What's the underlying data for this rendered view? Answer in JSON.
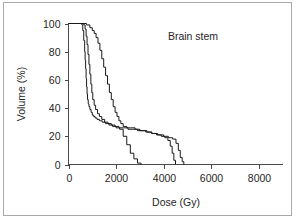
{
  "figure": {
    "background_color": "#ffffff",
    "border_color": "#a9a9a9",
    "line_color": "#1a1a1a",
    "text_color": "#262626"
  },
  "chart_data": {
    "type": "line",
    "title": "Brain stem",
    "xlabel": "Dose (Gy)",
    "ylabel": "Volume (%)",
    "xlim": [
      0,
      9000
    ],
    "ylim": [
      0,
      100
    ],
    "xticks": [
      0,
      2000,
      4000,
      6000,
      8000
    ],
    "xtick_labels": [
      "0",
      "2000",
      "4000",
      "6000",
      "8000"
    ],
    "yticks": [
      0,
      20,
      40,
      60,
      80,
      100
    ],
    "ytick_labels": [
      "0",
      "20",
      "40",
      "60",
      "80",
      "100"
    ],
    "grid": false,
    "legend": "none",
    "series": [
      {
        "name": "curve-1",
        "x": [
          0,
          420,
          560,
          600,
          640,
          680,
          700,
          720,
          740,
          760,
          780,
          800,
          830,
          860,
          900,
          950,
          1000,
          1060,
          1120,
          1200,
          1300,
          1420,
          1560,
          1700,
          1850,
          2000,
          2150,
          2300,
          2450,
          2600,
          2750,
          2900,
          3050
        ],
        "y": [
          100,
          100,
          99,
          95,
          88,
          80,
          74,
          68,
          61,
          55,
          50,
          46,
          43,
          41,
          39,
          37,
          35,
          34,
          33,
          32,
          31,
          30,
          29,
          28,
          27,
          26,
          25,
          20,
          14,
          8,
          4,
          1,
          0
        ]
      },
      {
        "name": "curve-2",
        "x": [
          0,
          500,
          640,
          700,
          740,
          780,
          820,
          860,
          900,
          940,
          980,
          1020,
          1080,
          1140,
          1220,
          1300,
          1400,
          1520,
          1660,
          1800,
          1960,
          2120,
          2300,
          2500,
          2700,
          2900,
          3100,
          3300,
          3500,
          3700,
          3900,
          4050,
          4180,
          4280,
          4360,
          4430,
          4500
        ],
        "y": [
          100,
          100,
          99,
          96,
          91,
          85,
          78,
          71,
          64,
          57,
          51,
          46,
          42,
          39,
          36,
          34,
          32,
          30,
          29,
          28,
          27,
          26,
          26,
          25,
          25,
          24,
          24,
          23,
          22,
          21,
          20,
          19,
          17,
          13,
          8,
          3,
          0
        ]
      },
      {
        "name": "curve-3",
        "x": [
          0,
          560,
          760,
          900,
          1000,
          1080,
          1160,
          1240,
          1320,
          1400,
          1480,
          1560,
          1640,
          1720,
          1800,
          1880,
          1960,
          2040,
          2120,
          2200,
          2300,
          2450,
          2600,
          2800,
          3000,
          3250,
          3500,
          3750,
          4000,
          4200,
          4380,
          4520,
          4620,
          4700,
          4780,
          4850
        ],
        "y": [
          100,
          100,
          99,
          97,
          95,
          93,
          90,
          86,
          81,
          75,
          69,
          63,
          57,
          51,
          46,
          41,
          37,
          34,
          31,
          29,
          27,
          26,
          26,
          25,
          24,
          23,
          22,
          21,
          20,
          19,
          18,
          15,
          10,
          5,
          2,
          0
        ]
      }
    ]
  }
}
